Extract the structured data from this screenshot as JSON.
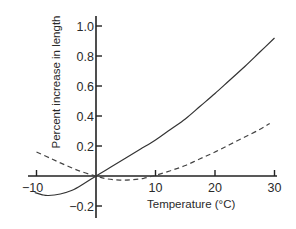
{
  "chart_data": {
    "type": "line",
    "title": "",
    "xlabel": "Temperature (°C)",
    "ylabel": "Percent increase in length",
    "xlim": [
      -11,
      30
    ],
    "ylim": [
      -0.27,
      1.05
    ],
    "x_ticks": [
      -10,
      10,
      20,
      30
    ],
    "x_tick_labels": [
      "−10",
      "10",
      "20",
      "30"
    ],
    "y_ticks": [
      1.0,
      0.8,
      0.6,
      0.4,
      0.2,
      -0.2
    ],
    "y_tick_labels": [
      "1.0",
      "0.8",
      "0.6",
      "0.4",
      "0.2",
      "−0.2"
    ],
    "grid": false,
    "legend": "none",
    "series": [
      {
        "name": "solid",
        "style": "solid",
        "color": "#333333",
        "x": [
          -10.3,
          -9,
          -8,
          -6,
          -4,
          -2,
          0,
          2.5,
          5,
          7.5,
          10,
          12.5,
          15,
          17.5,
          20,
          22.5,
          25,
          27.5,
          30
        ],
        "y": [
          -0.11,
          -0.125,
          -0.13,
          -0.12,
          -0.095,
          -0.05,
          0,
          0.06,
          0.12,
          0.18,
          0.24,
          0.31,
          0.38,
          0.465,
          0.55,
          0.64,
          0.73,
          0.825,
          0.92
        ]
      },
      {
        "name": "dashed",
        "style": "dashed",
        "color": "#444444",
        "x": [
          -10,
          -7.5,
          -5,
          -2.5,
          0,
          2,
          4,
          6,
          8,
          10,
          12.5,
          15,
          17.5,
          20,
          22.5,
          25,
          27.5,
          29.2
        ],
        "y": [
          0.16,
          0.115,
          0.07,
          0.03,
          0,
          -0.02,
          -0.027,
          -0.025,
          -0.015,
          0.005,
          0.035,
          0.07,
          0.115,
          0.16,
          0.21,
          0.26,
          0.31,
          0.35
        ]
      }
    ]
  }
}
